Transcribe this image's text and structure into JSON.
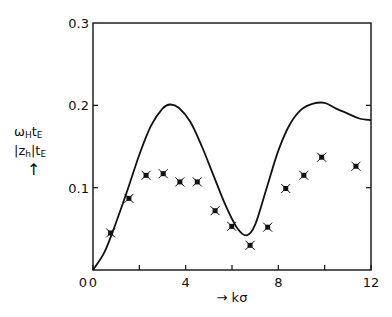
{
  "chart_data": {
    "type": "line",
    "title": "",
    "xlabel": "→ kσ",
    "ylabel_lines": [
      "ω_H t_E",
      "|z_h| t_E",
      "↑"
    ],
    "xlim": [
      0,
      12
    ],
    "ylim": [
      0,
      0.3
    ],
    "x_ticks": [
      0,
      2,
      4,
      6,
      8,
      10,
      12
    ],
    "x_tick_labels": [
      "0",
      "4",
      "8",
      "12"
    ],
    "y_tick_labels": [
      "0",
      "0.1",
      "0.2",
      "0.3"
    ],
    "grid": false,
    "legend": null,
    "series": [
      {
        "name": "ω_H t_E (curve)",
        "style": "solid line",
        "x": [
          0,
          0.5,
          1,
          1.5,
          2,
          2.5,
          3,
          3.33,
          3.7,
          4.2,
          4.7,
          5.2,
          5.7,
          6.2,
          6.63,
          7.0,
          7.5,
          8.0,
          8.5,
          9.0,
          9.5,
          10.0,
          10.5,
          11.0,
          11.5,
          12.0
        ],
        "y": [
          0,
          0.022,
          0.058,
          0.098,
          0.14,
          0.175,
          0.196,
          0.201,
          0.197,
          0.18,
          0.15,
          0.115,
          0.08,
          0.052,
          0.042,
          0.055,
          0.1,
          0.145,
          0.177,
          0.195,
          0.202,
          0.203,
          0.196,
          0.19,
          0.184,
          0.182
        ]
      },
      {
        "name": "|z_h| t_E (points)",
        "style": "boxed x markers",
        "x": [
          0.76,
          1.55,
          2.29,
          3.03,
          3.75,
          4.5,
          5.27,
          5.99,
          6.78,
          7.54,
          8.32,
          9.1,
          9.87,
          11.35
        ],
        "y": [
          0.045,
          0.087,
          0.115,
          0.117,
          0.107,
          0.107,
          0.072,
          0.053,
          0.03,
          0.052,
          0.099,
          0.115,
          0.137,
          0.126
        ]
      }
    ]
  },
  "labels": {
    "x_axis": "→ kσ",
    "y_line1_main": "ω",
    "y_line1_sub1": "H",
    "y_line1_t": "t",
    "y_line1_sub2": "E",
    "y_line2_main": "|z",
    "y_line2_sub1": "h",
    "y_line2_t": "|t",
    "y_line2_sub2": "E",
    "y_arrow": "↑"
  }
}
